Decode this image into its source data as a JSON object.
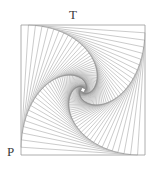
{
  "figure": {
    "type": "nested-rotating-squares-whirl",
    "labels": {
      "top": "T",
      "bottom_left": "P"
    },
    "top_cut_text": "",
    "square": {
      "left": 21,
      "top": 25,
      "right": 145,
      "bottom": 155
    },
    "iterations": 60,
    "step_fraction": 0.06,
    "colors": {
      "background": "#ffffff",
      "line": "#8a8a8a",
      "outer": "#9a9a9a",
      "label": "#3a3a3a"
    }
  }
}
